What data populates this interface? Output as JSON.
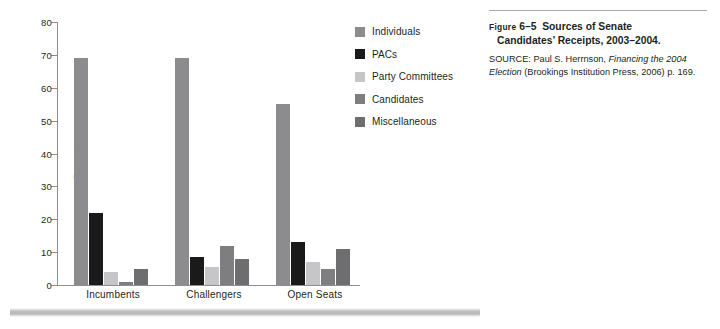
{
  "chart_data": {
    "type": "bar",
    "title": "",
    "xlabel": "",
    "ylabel": "Percentage",
    "ylim": [
      0,
      80
    ],
    "yticks": [
      0,
      10,
      20,
      30,
      40,
      50,
      60,
      70,
      80
    ],
    "grid": false,
    "legend_position": "right",
    "categories": [
      "Incumbents",
      "Challengers",
      "Open Seats"
    ],
    "series": [
      {
        "name": "Individuals",
        "color": "#8c8c8e",
        "values": [
          69,
          69,
          55
        ]
      },
      {
        "name": "PACs",
        "color": "#1a1a1a",
        "values": [
          22,
          8.5,
          13
        ]
      },
      {
        "name": "Party Committees",
        "color": "#c6c6c8",
        "values": [
          4,
          5.5,
          7
        ]
      },
      {
        "name": "Candidates",
        "color": "#7e7e80",
        "values": [
          1,
          12,
          5
        ]
      },
      {
        "name": "Miscellaneous",
        "color": "#6e6e70",
        "values": [
          5,
          8,
          11
        ]
      }
    ]
  },
  "legend": {
    "items": [
      {
        "label": "Individuals"
      },
      {
        "label": "PACs"
      },
      {
        "label": "Party Committees"
      },
      {
        "label": "Candidates"
      },
      {
        "label": "Miscellaneous"
      }
    ]
  },
  "caption": {
    "figure_word": "Figure",
    "figure_number": "6–5",
    "title_line1": "Sources of Senate",
    "title_line2": "Candidates’ Receipts, 2003–2004.",
    "source_prefix": "SOURCE: Paul S. Herrnson, ",
    "source_italic1": "Financing the 2004",
    "source_italic2": "Election",
    "source_suffix": " (Brookings Institution Press, 2006) p. 169."
  },
  "colors": {
    "axis": "#8e8e90",
    "text": "#231f20",
    "rule": "#a7a9ac"
  }
}
